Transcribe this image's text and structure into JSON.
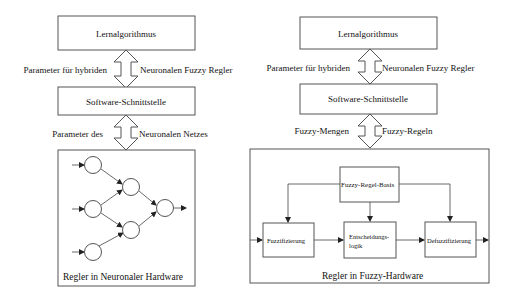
{
  "left_diagram": {
    "top_box": "Lernalgorithmus",
    "arrow1_left_label": "Parameter für hybriden",
    "arrow1_right_label": "Neuronalen Fuzzy Regler",
    "middle_box": "Software-Schnittstelle",
    "arrow2_left_label": "Parameter des",
    "arrow2_right_label": "Neuronalen Netzes",
    "bottom_box_label": "Regler in Neuronaler Hardware",
    "network": {
      "layers": [
        3,
        2,
        1
      ]
    }
  },
  "right_diagram": {
    "top_box": "Lernalgorithmus",
    "arrow1_left_label": "Parameter für hybriden",
    "arrow1_right_label": "Neuronalen Fuzzy Regler",
    "middle_box": "Software-Schnittstelle",
    "arrow2_left_label": "Fuzzy-Mengen",
    "arrow2_right_label": "Fuzzy-Regeln",
    "bottom_box_label": "Regler in Fuzzy-Hardware",
    "rule_base": "Fuzzy-Regel-Basis",
    "fuzzification": "Fuzzifizierung",
    "decision_logic_line1": "Entscheidungs-",
    "decision_logic_line2": "logik",
    "defuzzification": "Defuzzifizierung"
  }
}
